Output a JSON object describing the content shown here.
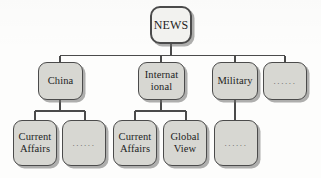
{
  "figure": {
    "type": "tree-diagram",
    "colors": {
      "node_fill": "#d7d7d2",
      "root_fill": "#f2f2ef",
      "border": "#4b4b4b",
      "shadow": "#6e6e6c",
      "text": "#1d1d1d",
      "background": "#fdfdfc"
    }
  },
  "nodes": {
    "root": {
      "label": "NEWS"
    },
    "level1": [
      {
        "label": "China"
      },
      {
        "label": "Internat\nional"
      },
      {
        "label": "Military"
      },
      {
        "label": "......"
      }
    ],
    "level2_china": [
      {
        "label": "Current\nAffairs"
      },
      {
        "label": "......"
      }
    ],
    "level2_international": [
      {
        "label": "Current\nAffairs"
      },
      {
        "label": "Global\nView"
      }
    ],
    "level2_military": [
      {
        "label": "......"
      }
    ]
  }
}
